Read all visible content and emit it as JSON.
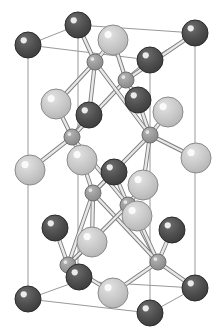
{
  "figure": {
    "background_color": "#ffffff",
    "width": 222,
    "height": 334
  },
  "legend": {
    "species": [
      {
        "name": "dark-atom",
        "label": "dark large sphere",
        "color": "#4a4a4a",
        "highlight": "#f2f2f2",
        "outline": "#2b2b2b",
        "radius": 13
      },
      {
        "name": "light-atom",
        "label": "light large sphere",
        "color": "#c9c9c9",
        "highlight": "#fbfbfb",
        "outline": "#8a8a8a",
        "radius": 15
      },
      {
        "name": "small-atom",
        "label": "small grey sphere",
        "color": "#9a9a9a",
        "highlight": "#e8e8e8",
        "outline": "#6e6e6e",
        "radius": 8
      }
    ]
  },
  "cell": {
    "edge_color": "#999999",
    "edge_width": 1,
    "vertices": {
      "top_back_left": [
        28,
        45
      ],
      "top_back_right": [
        195,
        33
      ],
      "top_front_left": [
        78,
        25
      ],
      "top_front_right": [
        150,
        60
      ],
      "bot_back_left": [
        28,
        299
      ],
      "bot_back_right": [
        195,
        288
      ],
      "bot_front_left": [
        78,
        281
      ],
      "bot_front_right": [
        150,
        313
      ]
    },
    "edges": [
      [
        "top_front_left",
        "top_back_left"
      ],
      [
        "top_front_left",
        "top_back_right"
      ],
      [
        "top_back_left",
        "top_front_right"
      ],
      [
        "top_back_right",
        "top_front_right"
      ],
      [
        "bot_front_left",
        "bot_back_left"
      ],
      [
        "bot_front_left",
        "bot_back_right"
      ],
      [
        "bot_back_left",
        "bot_front_right"
      ],
      [
        "bot_back_right",
        "bot_front_right"
      ],
      [
        "top_back_left",
        "bot_back_left"
      ],
      [
        "top_back_right",
        "bot_back_right"
      ],
      [
        "top_front_left",
        "bot_front_left"
      ],
      [
        "top_front_right",
        "bot_front_right"
      ]
    ]
  },
  "chart_data": {
    "type": "scatter",
    "xlabel": "",
    "ylabel": "",
    "atoms": [
      {
        "id": "d1",
        "species": "dark-atom",
        "x": 78,
        "y": 25
      },
      {
        "id": "d2",
        "species": "dark-atom",
        "x": 28,
        "y": 45
      },
      {
        "id": "d3",
        "species": "dark-atom",
        "x": 195,
        "y": 33
      },
      {
        "id": "d4",
        "species": "dark-atom",
        "x": 150,
        "y": 60
      },
      {
        "id": "d5",
        "species": "dark-atom",
        "x": 138,
        "y": 100
      },
      {
        "id": "d6",
        "species": "dark-atom",
        "x": 89,
        "y": 115
      },
      {
        "id": "d7",
        "species": "dark-atom",
        "x": 114,
        "y": 172
      },
      {
        "id": "d8",
        "species": "dark-atom",
        "x": 55,
        "y": 228
      },
      {
        "id": "d9",
        "species": "dark-atom",
        "x": 172,
        "y": 230
      },
      {
        "id": "d10",
        "species": "dark-atom",
        "x": 79,
        "y": 277
      },
      {
        "id": "d11",
        "species": "dark-atom",
        "x": 28,
        "y": 299
      },
      {
        "id": "d12",
        "species": "dark-atom",
        "x": 195,
        "y": 288
      },
      {
        "id": "d13",
        "species": "dark-atom",
        "x": 150,
        "y": 313
      },
      {
        "id": "l1",
        "species": "light-atom",
        "x": 113,
        "y": 40
      },
      {
        "id": "l2",
        "species": "light-atom",
        "x": 56,
        "y": 104
      },
      {
        "id": "l3",
        "species": "light-atom",
        "x": 168,
        "y": 112
      },
      {
        "id": "l4",
        "species": "light-atom",
        "x": 30,
        "y": 170
      },
      {
        "id": "l5",
        "species": "light-atom",
        "x": 82,
        "y": 160
      },
      {
        "id": "l6",
        "species": "light-atom",
        "x": 196,
        "y": 158
      },
      {
        "id": "l7",
        "species": "light-atom",
        "x": 143,
        "y": 185
      },
      {
        "id": "l8",
        "species": "light-atom",
        "x": 92,
        "y": 242
      },
      {
        "id": "l9",
        "species": "light-atom",
        "x": 137,
        "y": 216
      },
      {
        "id": "l10",
        "species": "light-atom",
        "x": 113,
        "y": 293
      },
      {
        "id": "s1",
        "species": "small-atom",
        "x": 95,
        "y": 62
      },
      {
        "id": "s2",
        "species": "small-atom",
        "x": 126,
        "y": 80
      },
      {
        "id": "s3",
        "species": "small-atom",
        "x": 72,
        "y": 137
      },
      {
        "id": "s4",
        "species": "small-atom",
        "x": 150,
        "y": 135
      },
      {
        "id": "s5",
        "species": "small-atom",
        "x": 93,
        "y": 193
      },
      {
        "id": "s6",
        "species": "small-atom",
        "x": 128,
        "y": 205
      },
      {
        "id": "s7",
        "species": "small-atom",
        "x": 68,
        "y": 265
      },
      {
        "id": "s8",
        "species": "small-atom",
        "x": 158,
        "y": 262
      }
    ],
    "bonds": [
      [
        "s1",
        "d1"
      ],
      [
        "s1",
        "l1"
      ],
      [
        "s1",
        "d6"
      ],
      [
        "s1",
        "l2"
      ],
      [
        "s2",
        "l1"
      ],
      [
        "s2",
        "d4"
      ],
      [
        "s2",
        "d5"
      ],
      [
        "s2",
        "d3"
      ],
      [
        "s3",
        "l2"
      ],
      [
        "s3",
        "d6"
      ],
      [
        "s3",
        "l5"
      ],
      [
        "s3",
        "l4"
      ],
      [
        "s4",
        "l3"
      ],
      [
        "s4",
        "d5"
      ],
      [
        "s4",
        "l7"
      ],
      [
        "s4",
        "l6"
      ],
      [
        "s5",
        "l5"
      ],
      [
        "s5",
        "d7"
      ],
      [
        "s5",
        "s7"
      ],
      [
        "s5",
        "l8"
      ],
      [
        "s6",
        "l7"
      ],
      [
        "s6",
        "d7"
      ],
      [
        "s6",
        "l9"
      ],
      [
        "s6",
        "s8"
      ],
      [
        "s7",
        "l8"
      ],
      [
        "s7",
        "d8"
      ],
      [
        "s7",
        "d10"
      ],
      [
        "s7",
        "l10"
      ],
      [
        "s8",
        "l9"
      ],
      [
        "s8",
        "d9"
      ],
      [
        "s8",
        "d12"
      ],
      [
        "s8",
        "l10"
      ],
      [
        "s2",
        "s3"
      ],
      [
        "s1",
        "s4"
      ],
      [
        "s3",
        "s6"
      ],
      [
        "s4",
        "s5"
      ],
      [
        "s5",
        "s8"
      ],
      [
        "s6",
        "s7"
      ]
    ]
  }
}
